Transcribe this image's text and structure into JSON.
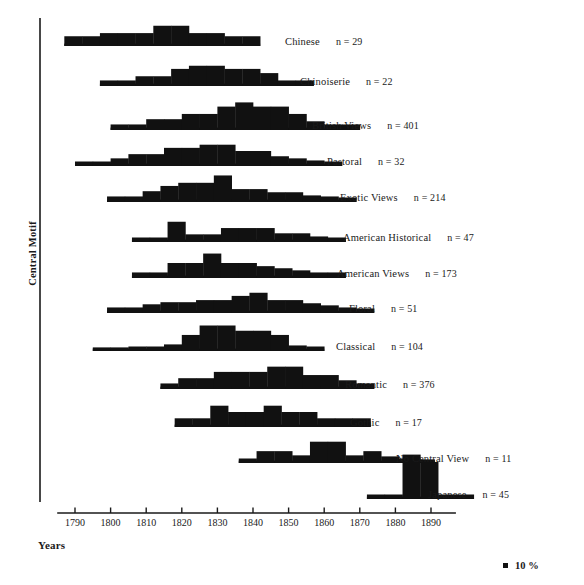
{
  "figure": {
    "y_axis_title": "Central Motif",
    "x_axis_title": "Years",
    "legend_label": "10 %",
    "legend_swatch_color": "#111111",
    "bar_color": "#111111",
    "axis_color": "#1a1a1a"
  },
  "chart_data": {
    "type": "bar",
    "title": "",
    "subtitle": "",
    "xlabel": "Years",
    "ylabel": "Central Motif",
    "grid": false,
    "legend_position": "bottom-right",
    "legend_entries": [
      "10 %"
    ],
    "xlim": [
      1785,
      1897
    ],
    "xticks": [
      1790,
      1800,
      1810,
      1820,
      1830,
      1840,
      1850,
      1860,
      1870,
      1880,
      1890
    ],
    "xticklabels": [
      "1790",
      "1800",
      "1810",
      "1820",
      "1830",
      "1840",
      "1850",
      "1860",
      "1870",
      "1880",
      "1890"
    ],
    "bin_width_years": 5,
    "value_unit": "percent",
    "scale_reference_percent": 10,
    "series": [
      {
        "name": "Chinese",
        "label": "Chinese",
        "n_label": "n = 29",
        "n": 29,
        "bin_start": 1787,
        "values": [
          7,
          7,
          10,
          10,
          10,
          17,
          17,
          10,
          10,
          7,
          7
        ]
      },
      {
        "name": "Chinoiserie",
        "label": "Chinoiserie",
        "n_label": "n = 22",
        "n": 22,
        "bin_start": 1797,
        "values": [
          3,
          3,
          7,
          7,
          14,
          17,
          17,
          14,
          14,
          10,
          3,
          3
        ]
      },
      {
        "name": "British Views",
        "label": "British Views",
        "n_label": "n = 401",
        "n": 401,
        "bin_start": 1800,
        "values": [
          3,
          3,
          8,
          8,
          13,
          13,
          20,
          24,
          20,
          20,
          13,
          6,
          3,
          3
        ]
      },
      {
        "name": "Pastoral",
        "label": "Pastoral",
        "n_label": "n = 32",
        "n": 32,
        "bin_start": 1790,
        "values": [
          2,
          2,
          5,
          9,
          9,
          15,
          15,
          18,
          18,
          12,
          12,
          7,
          5,
          3,
          2
        ]
      },
      {
        "name": "Exotic Views",
        "label": "Exotic Views",
        "n_label": "n = 214",
        "n": 214,
        "bin_start": 1799,
        "values": [
          3,
          3,
          8,
          13,
          16,
          16,
          23,
          10,
          10,
          7,
          7,
          4,
          3,
          2
        ]
      },
      {
        "name": "American Historical",
        "label": "American Historical",
        "n_label": "n = 47",
        "n": 47,
        "bin_start": 1806,
        "values": [
          2,
          2,
          17,
          5,
          5,
          11,
          11,
          11,
          6,
          6,
          3,
          2
        ]
      },
      {
        "name": "American Views",
        "label": "American Views",
        "n_label": "n = 173",
        "n": 173,
        "bin_start": 1806,
        "values": [
          3,
          3,
          12,
          12,
          21,
          12,
          12,
          9,
          7,
          5,
          3,
          3
        ]
      },
      {
        "name": "Floral",
        "label": "Floral",
        "n_label": "n = 51",
        "n": 51,
        "bin_start": 1799,
        "values": [
          3,
          3,
          6,
          8,
          8,
          10,
          10,
          14,
          17,
          10,
          10,
          7,
          5,
          3,
          2
        ]
      },
      {
        "name": "Classical",
        "label": "Classical",
        "n_label": "n = 104",
        "n": 104,
        "bin_start": 1795,
        "values": [
          1,
          1,
          2,
          2,
          4,
          13,
          22,
          22,
          17,
          17,
          13,
          3,
          2
        ]
      },
      {
        "name": "Romantic",
        "label": "Romantic",
        "n_label": "n = 376",
        "n": 376,
        "bin_start": 1814,
        "values": [
          3,
          8,
          8,
          14,
          14,
          14,
          19,
          19,
          11,
          11,
          6,
          3
        ]
      },
      {
        "name": "Gothic",
        "label": "Gothic",
        "n_label": "n = 17",
        "n": 17,
        "bin_start": 1818,
        "values": [
          6,
          6,
          18,
          12,
          12,
          18,
          12,
          12,
          6,
          6,
          6
        ]
      },
      {
        "name": "No Central View",
        "label": "No Central View",
        "n_label": "n = 11",
        "n": 11,
        "bin_start": 1836,
        "values": [
          2,
          9,
          9,
          5,
          18,
          18,
          5,
          9,
          4,
          2,
          1
        ]
      },
      {
        "name": "Japanese",
        "label": "Japanese",
        "n_label": "n = 45",
        "n": 45,
        "bin_start": 1872,
        "values": [
          2,
          2,
          40,
          33,
          2,
          2
        ]
      }
    ]
  },
  "rows": [
    {
      "label": "Chinese",
      "n_label": "n = 29",
      "label_x": 285,
      "label_y": 36
    },
    {
      "label": "Chinoiserie",
      "n_label": "n = 22",
      "label_x": 300,
      "label_y": 76
    },
    {
      "label": "British Views",
      "n_label": "n = 401",
      "label_x": 312,
      "label_y": 120
    },
    {
      "label": "Pastoral",
      "n_label": "n = 32",
      "label_x": 327,
      "label_y": 156
    },
    {
      "label": "Exotic Views",
      "n_label": "n = 214",
      "label_x": 340,
      "label_y": 192
    },
    {
      "label": "American Historical",
      "n_label": "n = 47",
      "label_x": 343,
      "label_y": 232
    },
    {
      "label": "American Views",
      "n_label": "n = 173",
      "label_x": 337,
      "label_y": 268
    },
    {
      "label": "Floral",
      "n_label": "n = 51",
      "label_x": 349,
      "label_y": 303
    },
    {
      "label": "Classical",
      "n_label": "n = 104",
      "label_x": 336,
      "label_y": 341
    },
    {
      "label": "Romantic",
      "n_label": "n = 376",
      "label_x": 345,
      "label_y": 379
    },
    {
      "label": "Gothic",
      "n_label": "n = 17",
      "label_x": 350,
      "label_y": 417
    },
    {
      "label": "No Central View",
      "n_label": "n = 11",
      "label_x": 396,
      "label_y": 453
    },
    {
      "label": "Japanese",
      "n_label": "n = 45",
      "label_x": 428,
      "label_y": 489
    }
  ],
  "row_baselines": [
    46,
    86,
    130,
    166,
    202,
    242,
    278,
    313,
    351,
    389,
    427,
    463,
    499
  ]
}
